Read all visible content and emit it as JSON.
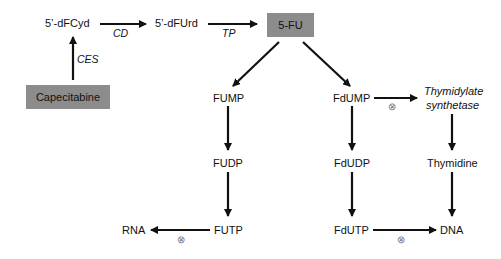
{
  "diagram": {
    "nodes": {
      "capecitabine": "Capecitabine",
      "dfcyd": "5’-dFCyd",
      "dfurd": "5’-dFUrd",
      "fu": "5-FU",
      "fump": "FUMP",
      "fudp": "FUDP",
      "futp": "FUTP",
      "rna": "RNA",
      "fdump": "FdUMP",
      "fdudp": "FdUDP",
      "fdutp": "FdUTP",
      "dna": "DNA",
      "ts_line1": "Thymidylate",
      "ts_line2": "synthetase",
      "thymidine": "Thymidine"
    },
    "enzymes": {
      "ces": "CES",
      "cd": "CD",
      "tp": "TP"
    },
    "inhibition_symbol": "⊗",
    "colors": {
      "box_fill": "#8c8c8c",
      "arrow": "#111111",
      "inhibition": "#777777"
    },
    "edges": [
      {
        "from": "Capecitabine",
        "to": "5’-dFCyd",
        "label": "CES"
      },
      {
        "from": "5’-dFCyd",
        "to": "5’-dFUrd",
        "label": "CD"
      },
      {
        "from": "5’-dFUrd",
        "to": "5-FU",
        "label": "TP"
      },
      {
        "from": "5-FU",
        "to": "FUMP"
      },
      {
        "from": "5-FU",
        "to": "FdUMP"
      },
      {
        "from": "FUMP",
        "to": "FUDP"
      },
      {
        "from": "FUDP",
        "to": "FUTP"
      },
      {
        "from": "FUTP",
        "to": "RNA",
        "inhibited": true
      },
      {
        "from": "FdUMP",
        "to": "Thymidylate synthetase",
        "inhibited": true
      },
      {
        "from": "FdUMP",
        "to": "FdUDP"
      },
      {
        "from": "FdUDP",
        "to": "FdUTP"
      },
      {
        "from": "FdUTP",
        "to": "DNA",
        "inhibited": true
      },
      {
        "from": "Thymidylate synthetase",
        "to": "Thymidine"
      },
      {
        "from": "Thymidine",
        "to": "DNA"
      }
    ]
  }
}
